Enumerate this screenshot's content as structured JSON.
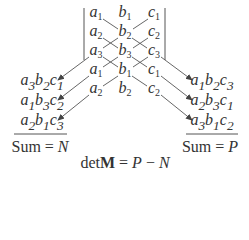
{
  "matrix": {
    "rows": [
      [
        {
          "v": "a",
          "s": "1"
        },
        {
          "v": "b",
          "s": "1"
        },
        {
          "v": "c",
          "s": "1"
        }
      ],
      [
        {
          "v": "a",
          "s": "2"
        },
        {
          "v": "b",
          "s": "2"
        },
        {
          "v": "c",
          "s": "2"
        }
      ],
      [
        {
          "v": "a",
          "s": "3"
        },
        {
          "v": "b",
          "s": "3"
        },
        {
          "v": "c",
          "s": "3"
        }
      ]
    ],
    "repeat_rows": [
      [
        {
          "v": "a",
          "s": "1"
        },
        {
          "v": "b",
          "s": "1"
        },
        {
          "v": "c",
          "s": "1"
        }
      ],
      [
        {
          "v": "a",
          "s": "2"
        },
        {
          "v": "b",
          "s": "2"
        },
        {
          "v": "c",
          "s": "2"
        }
      ]
    ]
  },
  "left_products": [
    [
      {
        "v": "a",
        "s": "3"
      },
      {
        "v": "b",
        "s": "2"
      },
      {
        "v": "c",
        "s": "1"
      }
    ],
    [
      {
        "v": "a",
        "s": "1"
      },
      {
        "v": "b",
        "s": "3"
      },
      {
        "v": "c",
        "s": "2"
      }
    ],
    [
      {
        "v": "a",
        "s": "2"
      },
      {
        "v": "b",
        "s": "1"
      },
      {
        "v": "c",
        "s": "3"
      }
    ]
  ],
  "right_products": [
    [
      {
        "v": "a",
        "s": "1"
      },
      {
        "v": "b",
        "s": "2"
      },
      {
        "v": "c",
        "s": "3"
      }
    ],
    [
      {
        "v": "a",
        "s": "2"
      },
      {
        "v": "b",
        "s": "3"
      },
      {
        "v": "c",
        "s": "1"
      }
    ],
    [
      {
        "v": "a",
        "s": "3"
      },
      {
        "v": "b",
        "s": "1"
      },
      {
        "v": "c",
        "s": "2"
      }
    ]
  ],
  "left_sum": {
    "label": "Sum = ",
    "var": "N"
  },
  "right_sum": {
    "label": "Sum = ",
    "var": "P"
  },
  "determinant": {
    "prefix": "det",
    "matrix": "M",
    "eq": " = ",
    "lhs": "P",
    "op": " − ",
    "rhs": "N"
  },
  "colors": {
    "text": "#333333",
    "lines": "#444444"
  }
}
